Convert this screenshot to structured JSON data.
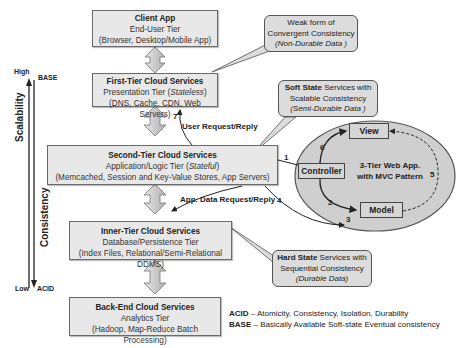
{
  "axis": {
    "scalability_label": "Scalability",
    "consistency_label": "Consistency",
    "high": "High",
    "low": "Low",
    "base": "BASE",
    "acid": "ACID"
  },
  "tiers": [
    {
      "title": "Client App",
      "subtitle": "End-User Tier",
      "detail": "(Browser, Desktop/Mobile App)"
    },
    {
      "title": "First-Tier Cloud Services",
      "subtitle_prefix": "Presentation Tier (",
      "subtitle_italic": "Stateless",
      "subtitle_suffix": ")",
      "detail": "(DNS, Cache, CDN, Web Servers)"
    },
    {
      "title": "Second-Tier Cloud Services",
      "subtitle_prefix": "Application/Logic Tier (",
      "subtitle_italic": "Stateful",
      "subtitle_suffix": ")",
      "detail": "(Memcached, Session and Key-Value Stores, App Servers)"
    },
    {
      "title": "Inner-Tier Cloud Services",
      "subtitle": "Database/Persistence Tier",
      "detail": "(Index Files, Relational/Semi-Relational DDMS)"
    },
    {
      "title": "Back-End Cloud Services",
      "subtitle": "Analytics Tier",
      "detail": "(Hadoop, Map-Reduce Batch Processing)"
    }
  ],
  "callouts": {
    "weak": {
      "line1": "Weak form of",
      "line2": "Convergent Consistency",
      "line3": "(Non-Durable Data )"
    },
    "soft": {
      "bold": "Soft State",
      "line1_rest": " Services with",
      "line2": "Scalable Consistency",
      "line3": "(Semi-Durable Data )"
    },
    "hard": {
      "bold": "Hard State",
      "line1_rest": " Services with",
      "line2": "Sequential Consistency",
      "line3": "(Durable Data)"
    }
  },
  "flows": {
    "user_request": "User Request/Reply",
    "app_data_request": "App. Data Request/Reply"
  },
  "mvc": {
    "title_line1": "3-Tier Web App.",
    "title_line2": "with MVC Pattern",
    "view": "View",
    "controller": "Controller",
    "model": "Model",
    "steps": [
      "1",
      "2",
      "3",
      "4",
      "5",
      "6",
      "7"
    ]
  },
  "legend": {
    "acid_key": "ACID",
    "acid_desc": " – Atomicity, Consistency, Isolation, Durability",
    "base_key": "BASE",
    "base_desc": " – Basically Available Soft-state Eventual consistency"
  },
  "colors": {
    "box_fill": "#e8e8e8",
    "callout_fill": "#dcdcdc",
    "ellipse_fill": "#cfcfcf",
    "arrow_fill": "#c8c8c8"
  }
}
